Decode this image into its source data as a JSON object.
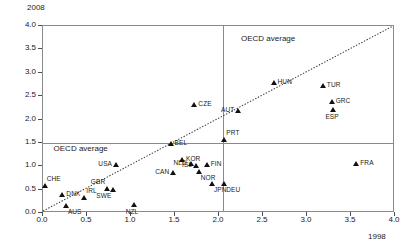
{
  "chart_data": {
    "type": "scatter",
    "title": "",
    "xlabel": "1998",
    "ylabel": "2008",
    "xlim": [
      0.0,
      4.0
    ],
    "ylim": [
      0.0,
      4.0
    ],
    "xticks": [
      "0.0",
      "0.5",
      "1.0",
      "1.5",
      "2.0",
      "2.5",
      "3.0",
      "3.5",
      "4.0"
    ],
    "yticks": [
      "0.0",
      "0.5",
      "1.0",
      "1.5",
      "2.0",
      "2.5",
      "3.0",
      "3.5",
      "4.0"
    ],
    "grid": false,
    "legend": "none",
    "reference_lines": {
      "oecd_average_x": 2.05,
      "oecd_average_y": 1.5,
      "diagonal": "y = x"
    },
    "annotations": [
      {
        "text": "OECD average",
        "x": 2.25,
        "y": 3.72,
        "name": "oecd-average-vertical-label"
      },
      {
        "text": "OECD average",
        "x": 0.12,
        "y": 1.36,
        "name": "oecd-average-horizontal-label"
      }
    ],
    "points": [
      {
        "code": "CHE",
        "x": 0.02,
        "y": 0.58,
        "pos": "tr"
      },
      {
        "code": "DNK",
        "x": 0.22,
        "y": 0.38,
        "pos": "r"
      },
      {
        "code": "AUS",
        "x": 0.26,
        "y": 0.16,
        "pos": "br"
      },
      {
        "code": "IRL",
        "x": 0.47,
        "y": 0.33,
        "pos": "tr"
      },
      {
        "code": "GBR",
        "x": 0.73,
        "y": 0.52,
        "pos": "tl"
      },
      {
        "code": "SWE",
        "x": 0.8,
        "y": 0.5,
        "pos": "bl"
      },
      {
        "code": "USA",
        "x": 0.83,
        "y": 1.02,
        "pos": "l"
      },
      {
        "code": "NZL",
        "x": 1.03,
        "y": 0.18,
        "pos": "b"
      },
      {
        "code": "BEL",
        "x": 1.45,
        "y": 1.47,
        "pos": "r"
      },
      {
        "code": "CAN",
        "x": 1.48,
        "y": 0.85,
        "pos": "l"
      },
      {
        "code": "CZE",
        "x": 1.72,
        "y": 2.3,
        "pos": "r"
      },
      {
        "code": "KOR",
        "x": 1.58,
        "y": 1.13,
        "pos": "r"
      },
      {
        "code": "NLD",
        "x": 1.68,
        "y": 1.05,
        "pos": "l"
      },
      {
        "code": "ISL",
        "x": 1.74,
        "y": 1.0,
        "pos": "l"
      },
      {
        "code": "FIN",
        "x": 1.86,
        "y": 1.03,
        "pos": "r"
      },
      {
        "code": "NOR",
        "x": 1.77,
        "y": 0.88,
        "pos": "br"
      },
      {
        "code": "AUT",
        "x": 2.22,
        "y": 2.18,
        "pos": "l"
      },
      {
        "code": "PRT",
        "x": 2.06,
        "y": 1.57,
        "pos": "tr"
      },
      {
        "code": "JPN",
        "x": 1.92,
        "y": 0.62,
        "pos": "br"
      },
      {
        "code": "DEU",
        "x": 2.06,
        "y": 0.62,
        "pos": "br"
      },
      {
        "code": "HUN",
        "x": 2.62,
        "y": 2.78,
        "pos": "r"
      },
      {
        "code": "TUR",
        "x": 3.18,
        "y": 2.72,
        "pos": "r"
      },
      {
        "code": "GRC",
        "x": 3.28,
        "y": 2.37,
        "pos": "r"
      },
      {
        "code": "ESP",
        "x": 3.3,
        "y": 2.2,
        "pos": "b"
      },
      {
        "code": "FRA",
        "x": 3.56,
        "y": 1.05,
        "pos": "r"
      }
    ]
  }
}
